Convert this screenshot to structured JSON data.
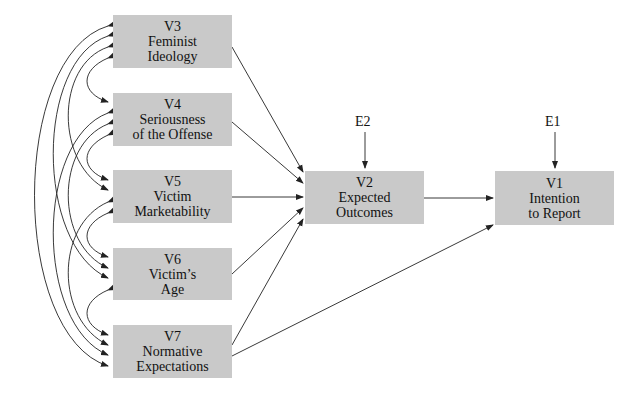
{
  "diagram": {
    "type": "path-model",
    "nodes": [
      {
        "id": "V3",
        "code": "V3",
        "label1": "Feminist",
        "label2": "Ideology"
      },
      {
        "id": "V4",
        "code": "V4",
        "label1": "Seriousness",
        "label2": "of the Offense"
      },
      {
        "id": "V5",
        "code": "V5",
        "label1": "Victim",
        "label2": "Marketability"
      },
      {
        "id": "V6",
        "code": "V6",
        "label1": "Victim’s",
        "label2": "Age"
      },
      {
        "id": "V7",
        "code": "V7",
        "label1": "Normative",
        "label2": "Expectations"
      },
      {
        "id": "V2",
        "code": "V2",
        "label1": "Expected",
        "label2": "Outcomes"
      },
      {
        "id": "V1",
        "code": "V1",
        "label1": "Intention",
        "label2": "to Report"
      }
    ],
    "errors": [
      {
        "id": "E2",
        "label": "E2",
        "target": "V2"
      },
      {
        "id": "E1",
        "label": "E1",
        "target": "V1"
      }
    ],
    "edges": [
      [
        "V3",
        "V2"
      ],
      [
        "V4",
        "V2"
      ],
      [
        "V5",
        "V2"
      ],
      [
        "V6",
        "V2"
      ],
      [
        "V7",
        "V2"
      ],
      [
        "V7",
        "V1"
      ],
      [
        "V2",
        "V1"
      ],
      [
        "E2",
        "V2"
      ],
      [
        "E1",
        "V1"
      ]
    ],
    "correlations": "all pairs among V3–V7 (double-headed curved arrows)",
    "colors": {
      "box_fill": "#c9c9c9",
      "line": "#222222"
    }
  }
}
